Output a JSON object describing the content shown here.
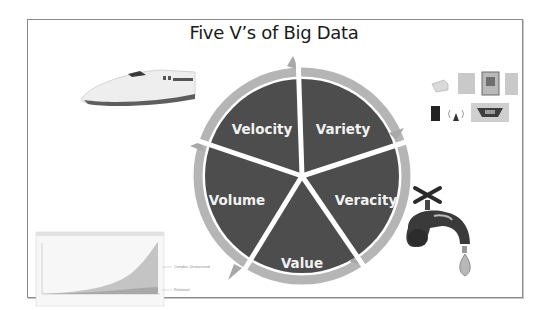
{
  "slide": {
    "title": "Five V’s of Big Data"
  },
  "diagram": {
    "segments": [
      {
        "label": "Velocity"
      },
      {
        "label": "Variety"
      },
      {
        "label": "Veracity"
      },
      {
        "label": "Value"
      },
      {
        "label": "Volume"
      }
    ],
    "colors": {
      "segment_fill": "#4d4d4d",
      "ring": "#b3b3b3",
      "separator": "#ffffff"
    }
  },
  "illustrations": {
    "train": "bullet-train-image",
    "file_icons": [
      "hard-drive-icon",
      "document-icon",
      "film-icon",
      "document-icon",
      "phone-icon",
      "wireless-icon",
      "screen-icon"
    ],
    "faucet": "dripping-faucet-image",
    "growth_chart": {
      "labels": [
        "Complex, Unstructured",
        "Relational"
      ]
    }
  }
}
